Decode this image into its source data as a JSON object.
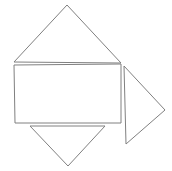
{
  "canvas": {
    "width": 172,
    "height": 171,
    "background_color": "#ffffff",
    "stroke_color": "#808080",
    "stroke_width": 1,
    "fill": "none"
  },
  "figure": {
    "shape_count": 4
  },
  "shapes": [
    {
      "name": "triangle-up",
      "type": "triangle",
      "orientation": "up",
      "points": "67,5 121,63 14,62",
      "vertices": [
        [
          67,
          5
        ],
        [
          121,
          63
        ],
        [
          14,
          62
        ]
      ]
    },
    {
      "name": "rectangle",
      "type": "rectangle",
      "orientation": "horizontal",
      "points": "14,65 121,64 121,123 15,123",
      "vertices": [
        [
          14,
          65
        ],
        [
          121,
          64
        ],
        [
          121,
          123
        ],
        [
          15,
          123
        ]
      ]
    },
    {
      "name": "triangle-right",
      "type": "triangle",
      "orientation": "right",
      "points": "124,66 165,110 126,144",
      "vertices": [
        [
          124,
          66
        ],
        [
          165,
          110
        ],
        [
          126,
          144
        ]
      ]
    },
    {
      "name": "triangle-down",
      "type": "triangle",
      "orientation": "down",
      "points": "30,126 105,126 68,166",
      "vertices": [
        [
          30,
          126
        ],
        [
          105,
          126
        ],
        [
          68,
          166
        ]
      ]
    }
  ]
}
